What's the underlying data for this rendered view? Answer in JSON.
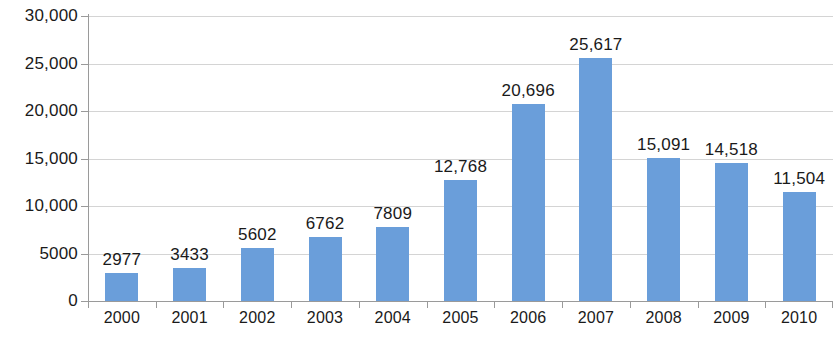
{
  "chart_data": {
    "type": "bar",
    "title": "",
    "subtitle": "",
    "xlabel": "",
    "ylabel": "",
    "categories": [
      "2000",
      "2001",
      "2002",
      "2003",
      "2004",
      "2005",
      "2006",
      "2007",
      "2008",
      "2009",
      "2010"
    ],
    "values": [
      2977,
      3433,
      5602,
      6762,
      7809,
      12768,
      20696,
      25617,
      15091,
      14518,
      11504
    ],
    "data_labels": [
      "2977",
      "3433",
      "5602",
      "6762",
      "7809",
      "12,768",
      "20,696",
      "25,617",
      "15,091",
      "14,518",
      "11,504"
    ],
    "series": [
      {
        "name": "",
        "values": [
          2977,
          3433,
          5602,
          6762,
          7809,
          12768,
          20696,
          25617,
          15091,
          14518,
          11504
        ],
        "color": "#6a9eda"
      }
    ],
    "ylim": [
      0,
      30000
    ],
    "y_tick_values": [
      0,
      5000,
      10000,
      15000,
      20000,
      25000,
      30000
    ],
    "y_tick_labels": [
      "0",
      "5000",
      "10,000",
      "15,000",
      "20,000",
      "25,000",
      "30,000"
    ],
    "grid": true,
    "grid_axis": "y",
    "legend": false,
    "legend_position": "none",
    "colors": {
      "bar": "#6a9eda",
      "gridline": "#d4d4d4",
      "axis": "#9a9a9a",
      "text": "#1a1a1a",
      "background": "#ffffff"
    }
  }
}
